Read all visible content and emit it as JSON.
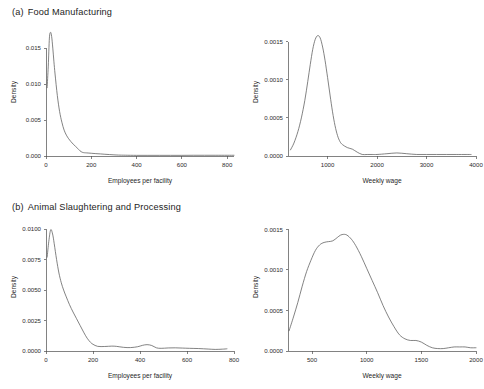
{
  "figure": {
    "background": "#ffffff",
    "line_color": "#5a5a5a",
    "axis_color": "#4d4d4d"
  },
  "panels": [
    {
      "tag": "(a)",
      "caption": "Food Manufacturing"
    },
    {
      "tag": "(b)",
      "caption": "Animal Slaughtering and Processing"
    }
  ],
  "chart_data": [
    {
      "type": "line",
      "panel": "(a)",
      "panel_title": "Food Manufacturing",
      "position": "top-left",
      "title": "",
      "xlabel": "Employees per facility",
      "ylabel": "Density",
      "grid": false,
      "legend": "none",
      "xlim": [
        0,
        830
      ],
      "ylim": [
        0,
        0.0178
      ],
      "xticks": [
        0,
        200,
        400,
        600,
        800
      ],
      "xticklabels": [
        "0",
        "200",
        "400",
        "600",
        "800"
      ],
      "yticks": [
        0.0,
        0.005,
        0.01,
        0.015
      ],
      "yticklabels": [
        "0.000",
        "0.005",
        "0.010",
        "0.015"
      ],
      "x": [
        5,
        10,
        15,
        20,
        25,
        30,
        35,
        40,
        50,
        60,
        70,
        80,
        90,
        100,
        110,
        120,
        130,
        140,
        150,
        160,
        170,
        180,
        200,
        220,
        240,
        260,
        280,
        300,
        320,
        350,
        400,
        450,
        500,
        550,
        600,
        650,
        700,
        750,
        800,
        830
      ],
      "y": [
        0.0095,
        0.0125,
        0.0164,
        0.0172,
        0.0166,
        0.015,
        0.0131,
        0.0114,
        0.0084,
        0.0062,
        0.0047,
        0.0036,
        0.0029,
        0.0024,
        0.002,
        0.00165,
        0.00135,
        0.00105,
        0.00072,
        0.00052,
        0.00045,
        0.00043,
        0.00038,
        0.00033,
        0.00029,
        0.00024,
        0.0002,
        0.00016,
        0.00013,
        0.00011,
        9e-05,
        9e-05,
        9e-05,
        9e-05,
        9e-05,
        0.0001,
        0.0001,
        0.0001,
        0.0001,
        0.0001
      ]
    },
    {
      "type": "line",
      "panel": "(a)",
      "panel_title": "Food Manufacturing",
      "position": "top-right",
      "title": "",
      "xlabel": "Weekly wage",
      "ylabel": "Density",
      "grid": false,
      "legend": "none",
      "xlim": [
        200,
        4000
      ],
      "ylim": [
        0,
        0.00168
      ],
      "xticks": [
        1000,
        2000,
        3000,
        4000
      ],
      "xticklabels": [
        "1000",
        "2000",
        "3000",
        "4000"
      ],
      "yticks": [
        0.0,
        0.0005,
        0.001,
        0.0015
      ],
      "yticklabels": [
        "0.0000",
        "0.0005",
        "0.0010",
        "0.0015"
      ],
      "x": [
        250,
        320,
        400,
        470,
        540,
        600,
        650,
        700,
        750,
        800,
        850,
        900,
        950,
        1000,
        1050,
        1100,
        1150,
        1200,
        1250,
        1300,
        1400,
        1500,
        1600,
        1700,
        1800,
        1900,
        2000,
        2200,
        2400,
        2600,
        2800,
        3000,
        3200,
        3400,
        3600,
        3800,
        3900
      ],
      "y": [
        8e-05,
        0.00017,
        0.00032,
        0.0005,
        0.00073,
        0.00098,
        0.0012,
        0.0014,
        0.00153,
        0.00158,
        0.00155,
        0.00143,
        0.00125,
        0.00103,
        0.0008,
        0.00058,
        0.0004,
        0.00027,
        0.00019,
        0.00015,
        0.00011,
        9e-05,
        5e-05,
        2e-05,
        2e-05,
        2e-05,
        2e-05,
        3e-05,
        4e-05,
        3e-05,
        2e-05,
        2e-05,
        2e-05,
        2e-05,
        2e-05,
        2e-05,
        2e-05
      ]
    },
    {
      "type": "line",
      "panel": "(b)",
      "panel_title": "Animal Slaughtering and Processing",
      "position": "bottom-left",
      "title": "",
      "xlabel": "Employees per facility",
      "ylabel": "Density",
      "grid": false,
      "legend": "none",
      "xlim": [
        0,
        800
      ],
      "ylim": [
        0,
        0.0105
      ],
      "xticks": [
        0,
        200,
        400,
        600,
        800
      ],
      "xticklabels": [
        "0",
        "200",
        "400",
        "600",
        "800"
      ],
      "yticks": [
        0.0,
        0.0025,
        0.005,
        0.0075,
        0.01
      ],
      "yticklabels": [
        "0.0000",
        "0.0025",
        "0.0050",
        "0.0075",
        "0.0100"
      ],
      "x": [
        5,
        12,
        20,
        28,
        35,
        45,
        55,
        65,
        75,
        85,
        100,
        115,
        130,
        145,
        160,
        175,
        190,
        200,
        220,
        250,
        280,
        300,
        330,
        360,
        390,
        410,
        430,
        450,
        470,
        490,
        520,
        550,
        580,
        610,
        650,
        690,
        720,
        750,
        770
      ],
      "y": [
        0.0077,
        0.009,
        0.00995,
        0.0096,
        0.0088,
        0.0075,
        0.0064,
        0.0056,
        0.005,
        0.0045,
        0.0038,
        0.0032,
        0.00265,
        0.0021,
        0.00155,
        0.00105,
        0.0007,
        0.00055,
        0.00038,
        0.00037,
        0.0004,
        0.00038,
        0.0003,
        0.00028,
        0.00035,
        0.00046,
        0.00052,
        0.00045,
        0.00026,
        0.00022,
        0.00025,
        0.00026,
        0.00024,
        0.00022,
        0.0002,
        0.00016,
        0.00013,
        0.00015,
        0.00018
      ]
    },
    {
      "type": "line",
      "panel": "(b)",
      "panel_title": "Animal Slaughtering and Processing",
      "position": "bottom-right",
      "title": "",
      "xlabel": "Weekly wage",
      "ylabel": "Density",
      "grid": false,
      "legend": "none",
      "xlim": [
        280,
        2000
      ],
      "ylim": [
        0,
        0.00158
      ],
      "xticks": [
        500,
        1000,
        1500,
        2000
      ],
      "xticklabels": [
        "500",
        "1000",
        "1500",
        "2000"
      ],
      "yticks": [
        0.0,
        0.0005,
        0.001,
        0.0015
      ],
      "yticklabels": [
        "0.0000",
        "0.0005",
        "0.0010",
        "0.0015"
      ],
      "x": [
        290,
        330,
        370,
        410,
        450,
        490,
        530,
        570,
        610,
        650,
        690,
        730,
        760,
        790,
        820,
        860,
        900,
        950,
        1000,
        1050,
        1100,
        1150,
        1200,
        1250,
        1300,
        1350,
        1400,
        1450,
        1500,
        1550,
        1600,
        1650,
        1700,
        1750,
        1800,
        1850,
        1900,
        1950,
        2000
      ],
      "y": [
        0.00025,
        0.00042,
        0.0006,
        0.0008,
        0.00098,
        0.00112,
        0.00124,
        0.00131,
        0.00134,
        0.00135,
        0.00136,
        0.0014,
        0.00143,
        0.00144,
        0.00143,
        0.00138,
        0.0013,
        0.00117,
        0.00102,
        0.00087,
        0.00072,
        0.00056,
        0.00042,
        0.0003,
        0.0002,
        0.00015,
        0.00013,
        0.00013,
        0.00011,
        7e-05,
        4e-05,
        3e-05,
        3e-05,
        4e-05,
        5e-05,
        5e-05,
        5e-05,
        4e-05,
        4e-05
      ]
    }
  ]
}
